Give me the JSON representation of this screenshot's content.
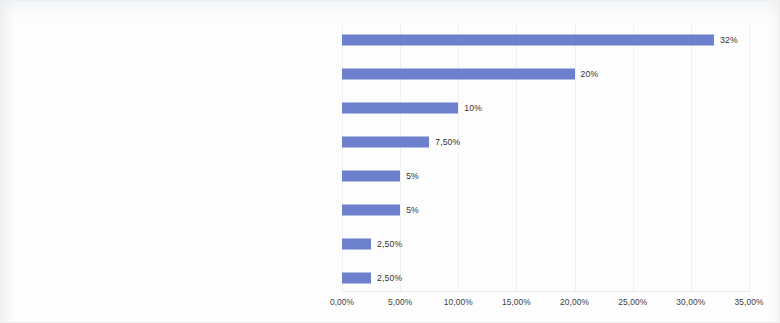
{
  "chart_data": {
    "type": "bar",
    "orientation": "horizontal",
    "title": "",
    "subtitle": "",
    "xlabel": "",
    "ylabel": "",
    "xlim": [
      0,
      35
    ],
    "xtick_labels": [
      "0,00%",
      "5,00%",
      "10,00%",
      "15,00%",
      "20,00%",
      "25,00%",
      "30,00%",
      "35,00%"
    ],
    "xtick_values": [
      0,
      5,
      10,
      15,
      20,
      25,
      30,
      35
    ],
    "grid": true,
    "legend": false,
    "legend_position": "none",
    "bar_color": "#6d80cd",
    "categories": [
      "Results of own R&D",
      "Identification of market needs",
      "Inspiration from the competition",
      "Client's order",
      "Cooperation with science",
      "Willingness to distinguish oneself against the background of competition",
      "Willingness to adapt the technology to the needs of buyers",
      "Idea"
    ],
    "values": [
      32,
      20,
      10,
      7.5,
      5,
      5,
      2.5,
      2.5
    ],
    "data_labels": [
      "32%",
      "20%",
      "10%",
      "7,50%",
      "5%",
      "5%",
      "2,50%",
      "2,50%"
    ]
  }
}
